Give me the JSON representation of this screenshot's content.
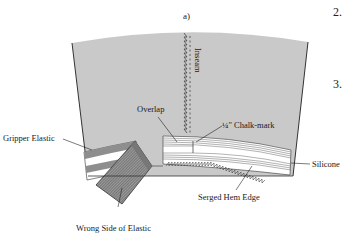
{
  "figure": {
    "panel_label": "a)",
    "step_numbers": [
      "2.",
      "3."
    ]
  },
  "labels": {
    "inseam": "Inseam",
    "overlap": "Overlap",
    "chalk_mark": "¼\" Chalk-mark",
    "gripper_elastic": "Gripper Elastic",
    "silicone": "Silicone",
    "serged_hem_edge": "Serged Hem Edge",
    "wrong_side_of_elastic": "Wrong Side of Elastic"
  },
  "colors": {
    "fabric": "#c8c8c8",
    "outline": "#333333",
    "elastic_hatch": "#8a8a8a",
    "background": "#ffffff"
  }
}
